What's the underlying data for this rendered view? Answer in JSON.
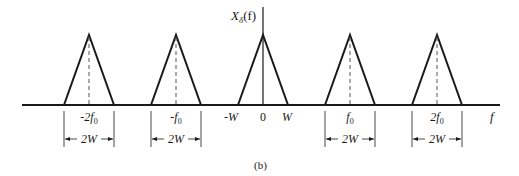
{
  "figure": {
    "caption": "(b)",
    "y_axis_label": {
      "main": "X",
      "sub": "δ",
      "arg": "(f)"
    },
    "x_axis_label": "f",
    "colors": {
      "line": "#1a1a1a",
      "dashed": "#555555",
      "background": "#ffffff"
    }
  },
  "spectrum": {
    "description": "Sampled spectrum: triangular replicas of width 2W centered at multiples of f0",
    "replicas": [
      {
        "center_multiple": -2,
        "center_label": "-2f",
        "center_sub": "0",
        "width_label": "2W",
        "dashed_center": true
      },
      {
        "center_multiple": -1,
        "center_label": "-f",
        "center_sub": "0",
        "width_label": "2W",
        "dashed_center": true
      },
      {
        "center_multiple": 0,
        "left_label": "-W",
        "center_label": "0",
        "right_label": "W",
        "dashed_center": false
      },
      {
        "center_multiple": 1,
        "center_label": "f",
        "center_sub": "0",
        "width_label": "2W",
        "dashed_center": true
      },
      {
        "center_multiple": 2,
        "center_label": "2f",
        "center_sub": "0",
        "width_label": "2W",
        "dashed_center": true
      }
    ]
  }
}
